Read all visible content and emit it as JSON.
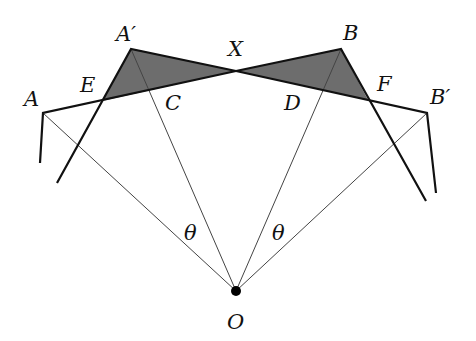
{
  "diagram": {
    "points": {
      "A": {
        "label": "A",
        "x": 43,
        "y": 113
      },
      "A_prime": {
        "label": "A′",
        "x": 131,
        "y": 49
      },
      "X": {
        "label": "X",
        "x": 236,
        "y": 71
      },
      "B": {
        "label": "B",
        "x": 341,
        "y": 49
      },
      "B_prime": {
        "label": "B′",
        "x": 427,
        "y": 113
      },
      "E": {
        "label": "E",
        "x": 102,
        "y": 101
      },
      "F": {
        "label": "F",
        "x": 368,
        "y": 100
      },
      "C": {
        "label": "C",
        "x": 150,
        "y": 90
      },
      "D": {
        "label": "D",
        "x": 323,
        "y": 89
      },
      "O": {
        "label": "O",
        "x": 236,
        "y": 291
      }
    },
    "angle_labels": [
      {
        "label": "θ",
        "x": 190,
        "y": 236
      },
      {
        "label": "θ",
        "x": 278,
        "y": 236
      }
    ],
    "colors": {
      "shade": "#6d6d6d",
      "thick_line": "#111111",
      "thin_line": "#444444"
    }
  }
}
